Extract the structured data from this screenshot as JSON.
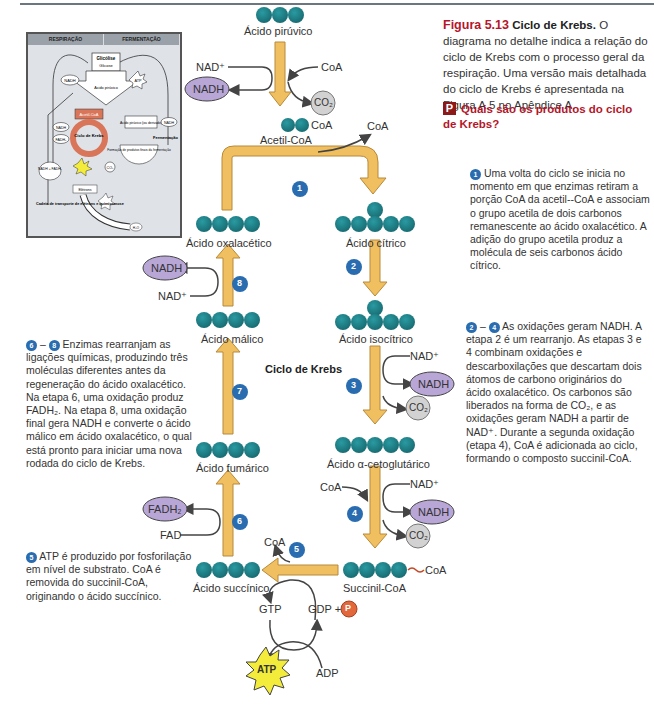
{
  "caption": {
    "figure_label": "Figura 5.13",
    "figure_title": "Ciclo de Krebs.",
    "text": "O diagrama no detalhe indica a relação do ciclo de Krebs com o processo geral da respiração. Uma versão mais detalhada do ciclo de Krebs é apresentada na Figura A.5 no Apêndice A.",
    "question_icon": "P",
    "question": "Quais são os produtos do ciclo de Krebs?"
  },
  "inset": {
    "headers": [
      "RESPIRAÇÃO",
      "FERMENTAÇÃO"
    ],
    "glicolise": "Glicólise",
    "glicose": "Glicose",
    "acido_piruvico": "Ácido pirúvico",
    "nadh": "NADH",
    "atp": "ATP",
    "acetil_coa": "Acetil-CoA",
    "ciclo_krebs": "Ciclo de Krebs",
    "fadh2": "FADH₂",
    "nadh_fadh2": "NADH + FADH₂",
    "co2": "CO₂",
    "piruvico_derivado": "Ácido pirúvico (ou derivado)",
    "fermentacao": "Fermentação",
    "produtos_finais": "Formação de produtos finais da fermentação",
    "eletrons": "Elétrons",
    "cadeia": "Cadeia de transporte de elétrons e quimiosmose",
    "h2o": "H₂O"
  },
  "diagram": {
    "title": "Ciclo de Krebs",
    "molecules": {
      "acido_piruvico": "Ácido pirúvico",
      "acetil_coa": "Acetil-CoA",
      "acido_citrico": "Ácido cítrico",
      "acido_isocitrico": "Ácido isocítrico",
      "acido_cetoglutarico": "Ácido α-cetoglutárico",
      "succinil_coa": "Succinil-CoA",
      "acido_succinico": "Ácido succínico",
      "acido_fumarico": "Ácido fumárico",
      "acido_malico": "Ácido málico",
      "acido_oxalacetico": "Ácido oxalacético"
    },
    "labels": {
      "nad_plus": "NAD⁺",
      "nadh": "NADH",
      "coa": "CoA",
      "co2": "CO₂",
      "fad": "FAD",
      "fadh2": "FADH₂",
      "gtp": "GTP",
      "gdp_plus": "GDP +",
      "p": "P",
      "atp": "ATP",
      "adp": "ADP",
      "coa_link": "CoA"
    },
    "steps": [
      "1",
      "2",
      "3",
      "4",
      "5",
      "6",
      "7",
      "8"
    ],
    "colors": {
      "carbon": "#1e7f86",
      "arrow": "#f0c060",
      "arrow_border": "#b8893a",
      "nadh": "#b8a6d6",
      "co2": "#d2d2d2",
      "step_badge": "#2a6cb0",
      "atp": "#f4ec3a",
      "phosphate": "#e2673b"
    }
  },
  "notes": {
    "step1": "Uma volta do ciclo se inicia no momento em que enzimas retiram a porção CoA da acetil--CoA e associam o grupo acetila de dois carbonos remanescente ao ácido oxalacético. A adição do grupo acetila produz a molécula de seis carbonos ácido cítrico.",
    "steps2_4_a": "2",
    "steps2_4_b": "4",
    "steps2_4": "As oxidações geram NADH. A etapa 2 é um rearranjo. As etapas 3 e 4 combinam oxidações e descarboxilações que descartam dois átomos de carbono originários do ácido oxalacético. Os carbonos são liberados na forma de CO₂, e as oxidações geram NADH a partir de NAD⁺. Durante a segunda oxidação (etapa 4), CoA é adicionada ao ciclo, formando o composto succinil-CoA.",
    "steps6_8_a": "6",
    "steps6_8_b": "8",
    "steps6_8": "Enzimas rearranjam as ligações químicas, produzindo três moléculas diferentes antes da regeneração do ácido oxalacético. Na etapa 6, uma oxidação produz FADH₂. Na etapa 8, uma oxidação final gera NADH e converte o ácido málico em ácido oxalacético, o qual está pronto para iniciar uma nova rodada do ciclo de Krebs.",
    "step5": "ATP é produzido por fosforilação em nível de substrato. CoA é removida do succinil-CoA, originando o ácido succínico.",
    "dash": "–"
  }
}
